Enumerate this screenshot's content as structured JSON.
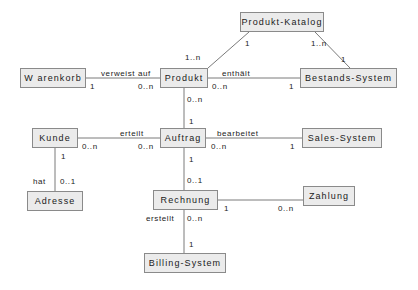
{
  "diagram": {
    "type": "uml-class-diagram",
    "canvas": {
      "width": 418,
      "height": 290
    },
    "style": {
      "node_fill": "#ebebeb",
      "node_border": "#8a8a8a",
      "line_color": "#7a7a7a",
      "text_color": "#1a1a1a",
      "background": "#ffffff"
    },
    "nodes": [
      {
        "id": "produkt-katalog",
        "label": "Produkt-Katalog",
        "x": 240,
        "y": 12,
        "w": 84,
        "h": 20
      },
      {
        "id": "warenkorb",
        "label": "W arenkorb",
        "x": 20,
        "y": 68,
        "w": 66,
        "h": 20
      },
      {
        "id": "produkt",
        "label": "Produkt",
        "x": 160,
        "y": 68,
        "w": 48,
        "h": 20
      },
      {
        "id": "bestands-system",
        "label": "Bestands-System",
        "x": 300,
        "y": 68,
        "w": 97,
        "h": 20
      },
      {
        "id": "kunde",
        "label": "Kunde",
        "x": 32,
        "y": 128,
        "w": 46,
        "h": 20
      },
      {
        "id": "auftrag",
        "label": "Auftrag",
        "x": 160,
        "y": 128,
        "w": 46,
        "h": 20
      },
      {
        "id": "sales-system",
        "label": "Sales-System",
        "x": 302,
        "y": 128,
        "w": 80,
        "h": 20
      },
      {
        "id": "adresse",
        "label": "Adresse",
        "x": 27,
        "y": 191,
        "w": 56,
        "h": 20
      },
      {
        "id": "rechnung",
        "label": "Rechnung",
        "x": 153,
        "y": 190,
        "w": 65,
        "h": 20
      },
      {
        "id": "zahlung",
        "label": "Zahlung",
        "x": 303,
        "y": 186,
        "w": 52,
        "h": 20
      },
      {
        "id": "billing-system",
        "label": "Billing-System",
        "x": 144,
        "y": 253,
        "w": 82,
        "h": 20
      }
    ],
    "edges": [
      {
        "id": "katalog-produkt",
        "from": "produkt-katalog",
        "to": "produkt",
        "label": "",
        "from_mult": "1",
        "to_mult": "1..n"
      },
      {
        "id": "katalog-bestands",
        "from": "produkt-katalog",
        "to": "bestands-system",
        "label": "",
        "from_mult": "1..n",
        "to_mult": "1"
      },
      {
        "id": "warenkorb-produkt",
        "from": "warenkorb",
        "to": "produkt",
        "label": "verweist auf",
        "from_mult": "1",
        "to_mult": "0..n"
      },
      {
        "id": "produkt-bestands",
        "from": "produkt",
        "to": "bestands-system",
        "label": "enthält",
        "from_mult": "0..n",
        "to_mult": "1"
      },
      {
        "id": "produkt-auftrag",
        "from": "produkt",
        "to": "auftrag",
        "label": "",
        "from_mult": "0..n",
        "to_mult": "1"
      },
      {
        "id": "kunde-auftrag",
        "from": "kunde",
        "to": "auftrag",
        "label": "erteilt",
        "from_mult": "0..n",
        "to_mult": "0..n"
      },
      {
        "id": "auftrag-sales",
        "from": "auftrag",
        "to": "sales-system",
        "label": "bearbeitet",
        "from_mult": "0..n",
        "to_mult": "1"
      },
      {
        "id": "kunde-adresse",
        "from": "kunde",
        "to": "adresse",
        "label": "hat",
        "from_mult": "1",
        "to_mult": "0..1"
      },
      {
        "id": "auftrag-rechnung",
        "from": "auftrag",
        "to": "rechnung",
        "label": "",
        "from_mult": "1",
        "to_mult": "0..1"
      },
      {
        "id": "rechnung-zahlung",
        "from": "rechnung",
        "to": "zahlung",
        "label": "",
        "from_mult": "1",
        "to_mult": "0..n"
      },
      {
        "id": "rechnung-billing",
        "from": "rechnung",
        "to": "billing-system",
        "label": "erstellt",
        "from_mult": "0..n",
        "to_mult": "1"
      }
    ],
    "annotations": [
      {
        "id": "a-katalog-left-mult",
        "text": "1",
        "x": 245,
        "y": 39
      },
      {
        "id": "a-katalog-right-mult",
        "text": "1..n",
        "x": 311,
        "y": 39
      },
      {
        "id": "a-produkt-up-mult",
        "text": "1..n",
        "x": 185,
        "y": 53
      },
      {
        "id": "a-bestands-up-mult",
        "text": "1",
        "x": 341,
        "y": 55
      },
      {
        "id": "a-verweist-label",
        "text": "verweist auf",
        "x": 101,
        "y": 69
      },
      {
        "id": "a-warenkorb-mult",
        "text": "1",
        "x": 90,
        "y": 82
      },
      {
        "id": "a-produkt-left-mult",
        "text": "0..n",
        "x": 138,
        "y": 82
      },
      {
        "id": "a-enthaelt-label",
        "text": "enthält",
        "x": 222,
        "y": 69
      },
      {
        "id": "a-produkt-right-mult",
        "text": "0..n",
        "x": 212,
        "y": 82
      },
      {
        "id": "a-bestands-left-mult",
        "text": "1",
        "x": 289,
        "y": 82
      },
      {
        "id": "a-produkt-down-mult",
        "text": "0..n",
        "x": 187,
        "y": 95
      },
      {
        "id": "a-auftrag-up-mult",
        "text": "1",
        "x": 189,
        "y": 117
      },
      {
        "id": "a-erteilt-label",
        "text": "erteilt",
        "x": 120,
        "y": 129
      },
      {
        "id": "a-kunde-right-mult",
        "text": "0..n",
        "x": 82,
        "y": 142
      },
      {
        "id": "a-auftrag-left-mult",
        "text": "0..n",
        "x": 138,
        "y": 142
      },
      {
        "id": "a-bearbeitet-label",
        "text": "bearbeitet",
        "x": 217,
        "y": 129
      },
      {
        "id": "a-auftrag-right-mult",
        "text": "0..n",
        "x": 211,
        "y": 142
      },
      {
        "id": "a-sales-left-mult",
        "text": "1",
        "x": 290,
        "y": 142
      },
      {
        "id": "a-kunde-down-mult",
        "text": "1",
        "x": 61,
        "y": 152
      },
      {
        "id": "a-hat-label",
        "text": "hat",
        "x": 33,
        "y": 177
      },
      {
        "id": "a-adresse-up-mult",
        "text": "0..1",
        "x": 60,
        "y": 177
      },
      {
        "id": "a-auftrag-down-mult",
        "text": "1",
        "x": 189,
        "y": 155
      },
      {
        "id": "a-rechnung-up-mult",
        "text": "0..1",
        "x": 187,
        "y": 176
      },
      {
        "id": "a-rechnung-right-mult",
        "text": "1",
        "x": 224,
        "y": 204
      },
      {
        "id": "a-zahlung-left-mult",
        "text": "0..n",
        "x": 278,
        "y": 204
      },
      {
        "id": "a-erstellt-label",
        "text": "erstellt",
        "x": 146,
        "y": 214
      },
      {
        "id": "a-rechnung-down-mult",
        "text": "0..n",
        "x": 187,
        "y": 214
      },
      {
        "id": "a-billing-up-mult",
        "text": "1",
        "x": 189,
        "y": 240
      }
    ],
    "lines": [
      {
        "id": "l-katalog-produkt",
        "x1": 249,
        "y1": 32,
        "x2": 208,
        "y2": 68
      },
      {
        "id": "l-katalog-bestands",
        "x1": 315,
        "y1": 32,
        "x2": 350,
        "y2": 68
      },
      {
        "id": "l-warenkorb-produkt",
        "x1": 86,
        "y1": 78,
        "x2": 160,
        "y2": 78
      },
      {
        "id": "l-produkt-bestands",
        "x1": 208,
        "y1": 78,
        "x2": 300,
        "y2": 78
      },
      {
        "id": "l-produkt-auftrag",
        "x1": 184,
        "y1": 88,
        "x2": 184,
        "y2": 128
      },
      {
        "id": "l-kunde-auftrag",
        "x1": 78,
        "y1": 138,
        "x2": 160,
        "y2": 138
      },
      {
        "id": "l-auftrag-sales",
        "x1": 206,
        "y1": 138,
        "x2": 302,
        "y2": 138
      },
      {
        "id": "l-kunde-adresse",
        "x1": 55,
        "y1": 148,
        "x2": 55,
        "y2": 191
      },
      {
        "id": "l-auftrag-rechnung",
        "x1": 184,
        "y1": 148,
        "x2": 184,
        "y2": 190
      },
      {
        "id": "l-rechnung-zahlung",
        "x1": 218,
        "y1": 200,
        "x2": 303,
        "y2": 200
      },
      {
        "id": "l-rechnung-billing",
        "x1": 184,
        "y1": 210,
        "x2": 184,
        "y2": 253
      }
    ]
  }
}
